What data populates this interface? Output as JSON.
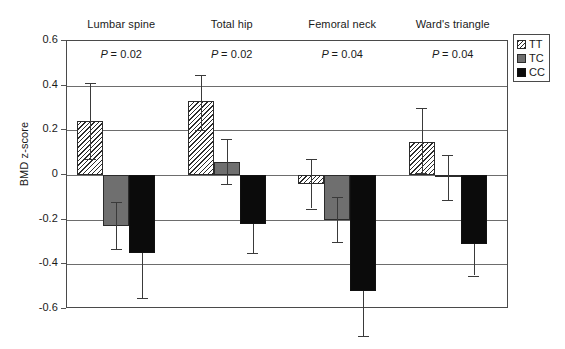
{
  "chart_data": {
    "type": "bar",
    "title": "",
    "xlabel": "",
    "ylabel": "BMD z-score",
    "ylim": [
      -0.6,
      0.6
    ],
    "ytick_labels": [
      "0.6",
      "0.4",
      "0.2",
      "0",
      "-0.2",
      "-0.4",
      "-0.6"
    ],
    "ytick_values": [
      0.6,
      0.4,
      0.2,
      0,
      -0.2,
      -0.4,
      -0.6
    ],
    "grid": true,
    "legend_position": "top-right",
    "categories": [
      "Lumbar spine",
      "Total hip",
      "Femoral neck",
      "Ward's triangle"
    ],
    "annotations": [
      "P = 0.02",
      "P = 0.02",
      "P = 0.04",
      "P = 0.04"
    ],
    "series": [
      {
        "name": "TT",
        "style": "hatched",
        "values": [
          0.24,
          0.33,
          -0.04,
          0.15
        ],
        "err_low": [
          0.07,
          0.2,
          -0.15,
          0.01
        ],
        "err_high": [
          0.41,
          0.45,
          0.07,
          0.3
        ]
      },
      {
        "name": "TC",
        "style": "gray",
        "values": [
          -0.23,
          0.06,
          -0.2,
          -0.01
        ],
        "err_low": [
          -0.33,
          -0.04,
          -0.3,
          -0.11
        ],
        "err_high": [
          -0.12,
          0.16,
          -0.1,
          0.09
        ]
      },
      {
        "name": "CC",
        "style": "black",
        "values": [
          -0.35,
          -0.22,
          -0.52,
          -0.31
        ],
        "err_low": [
          -0.55,
          -0.35,
          -0.72,
          -0.45
        ],
        "err_high": [
          -0.35,
          -0.22,
          -0.52,
          -0.31
        ]
      }
    ]
  },
  "legend": {
    "items": [
      {
        "label": "TT",
        "style": "tt"
      },
      {
        "label": "TC",
        "style": "tc"
      },
      {
        "label": "CC",
        "style": "cc"
      }
    ]
  },
  "axis": {
    "y_title": "BMD z-score"
  },
  "colors": {
    "tt_fill": "#ffffff",
    "tc_fill": "#6f6f6f",
    "cc_fill": "#0b0b0b",
    "outline": "#2b2b2b",
    "gridline": "#6d6d6d",
    "frame": "#4a4a4a"
  }
}
